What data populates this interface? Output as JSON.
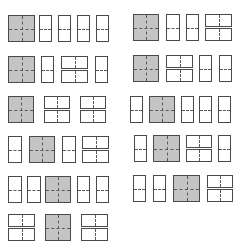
{
  "diagram": {
    "title": "",
    "colors": {
      "border": "#4a4a4a",
      "main_fill": "#c4c4c4",
      "panel_fill": "#ffffff",
      "fold_line": "#5a5a5a"
    },
    "layouts": [
      {
        "id": "L1",
        "y": 15,
        "h": 26,
        "items": [
          {
            "t": "sq",
            "x": 8,
            "w": 27
          },
          {
            "t": "p",
            "x": 39,
            "w": 13
          },
          {
            "t": "p",
            "x": 58,
            "w": 13
          },
          {
            "t": "p",
            "x": 77,
            "w": 13
          },
          {
            "t": "p",
            "x": 96,
            "w": 13
          }
        ]
      },
      {
        "id": "R1",
        "y": 14,
        "h": 26,
        "items": [
          {
            "t": "sq",
            "x": 133,
            "w": 26
          },
          {
            "t": "p",
            "x": 166,
            "w": 14
          },
          {
            "t": "p",
            "x": 186,
            "w": 13
          },
          {
            "t": "ll",
            "x": 205,
            "w": 27
          }
        ]
      },
      {
        "id": "L2",
        "y": 56,
        "h": 26,
        "items": [
          {
            "t": "sq",
            "x": 8,
            "w": 27
          },
          {
            "t": "p",
            "x": 41,
            "w": 13
          },
          {
            "t": "ll",
            "x": 61,
            "w": 27
          },
          {
            "t": "p",
            "x": 95,
            "w": 13
          }
        ]
      },
      {
        "id": "R2",
        "y": 55,
        "h": 26,
        "items": [
          {
            "t": "sq",
            "x": 133,
            "w": 26
          },
          {
            "t": "ll",
            "x": 166,
            "w": 27
          },
          {
            "t": "p",
            "x": 199,
            "w": 13
          },
          {
            "t": "p",
            "x": 219,
            "w": 13
          }
        ]
      },
      {
        "id": "L3",
        "y": 96,
        "h": 26,
        "items": [
          {
            "t": "sq",
            "x": 8,
            "w": 26
          },
          {
            "t": "ll",
            "x": 44,
            "w": 26
          },
          {
            "t": "ll",
            "x": 80,
            "w": 26
          }
        ]
      },
      {
        "id": "R3",
        "y": 96,
        "h": 26,
        "items": [
          {
            "t": "p",
            "x": 130,
            "w": 13
          },
          {
            "t": "sq",
            "x": 149,
            "w": 26
          },
          {
            "t": "p",
            "x": 181,
            "w": 13
          },
          {
            "t": "p",
            "x": 199,
            "w": 13
          },
          {
            "t": "p",
            "x": 218,
            "w": 13
          }
        ]
      },
      {
        "id": "L4",
        "y": 136,
        "h": 26,
        "items": [
          {
            "t": "p",
            "x": 8,
            "w": 14
          },
          {
            "t": "sq",
            "x": 29,
            "w": 26
          },
          {
            "t": "p",
            "x": 62,
            "w": 14
          },
          {
            "t": "ll",
            "x": 82,
            "w": 27
          }
        ]
      },
      {
        "id": "R4",
        "y": 135,
        "h": 26,
        "items": [
          {
            "t": "p",
            "x": 134,
            "w": 13
          },
          {
            "t": "sq",
            "x": 153,
            "w": 27
          },
          {
            "t": "ll",
            "x": 186,
            "w": 26
          },
          {
            "t": "p",
            "x": 218,
            "w": 13
          }
        ]
      },
      {
        "id": "L5",
        "y": 176,
        "h": 26,
        "items": [
          {
            "t": "p",
            "x": 8,
            "w": 14
          },
          {
            "t": "p",
            "x": 27,
            "w": 14
          },
          {
            "t": "sq",
            "x": 45,
            "w": 26
          },
          {
            "t": "p",
            "x": 77,
            "w": 13
          },
          {
            "t": "p",
            "x": 96,
            "w": 13
          }
        ]
      },
      {
        "id": "R5",
        "y": 175,
        "h": 26,
        "items": [
          {
            "t": "p",
            "x": 133,
            "w": 13
          },
          {
            "t": "p",
            "x": 153,
            "w": 13
          },
          {
            "t": "sq",
            "x": 173,
            "w": 27
          },
          {
            "t": "ll",
            "x": 207,
            "w": 26
          }
        ]
      },
      {
        "id": "L6",
        "y": 214,
        "h": 26,
        "items": [
          {
            "t": "ll",
            "x": 8,
            "w": 27
          },
          {
            "t": "sq",
            "x": 45,
            "w": 26
          },
          {
            "t": "ll",
            "x": 81,
            "w": 27
          }
        ]
      }
    ]
  }
}
